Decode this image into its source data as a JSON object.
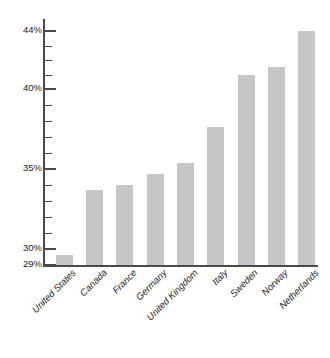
{
  "chart_data": {
    "type": "bar",
    "title": "",
    "subtitle": "",
    "xlabel": "",
    "ylabel": "",
    "categories": [
      "United States",
      "Canada",
      "France",
      "Germany",
      "United Kingdom",
      "Italy",
      "Sweden",
      "Norway",
      "Netherlands"
    ],
    "values": [
      29.6,
      33.7,
      34.0,
      34.7,
      35.4,
      37.6,
      41.0,
      41.5,
      44.0
    ],
    "value_unit": "%",
    "ylim": [
      29,
      44.6
    ],
    "ytick_labels": [
      "29%",
      "30%",
      "35%",
      "40%",
      "44%"
    ],
    "ytick_values": [
      29,
      30,
      35,
      40,
      44
    ],
    "minor_tick_values": [
      31,
      32,
      33,
      34,
      36,
      37,
      38,
      39,
      41,
      42,
      43
    ],
    "grid": false,
    "legend": false,
    "bar_color": "#c6c6c6",
    "axis_color": "#4a4a4a",
    "background_color": "#ffffff"
  },
  "axis": {
    "y_tick_labels": [
      {
        "text": "44%",
        "value": 44
      },
      {
        "text": "40%",
        "value": 40
      },
      {
        "text": "35%",
        "value": 35
      },
      {
        "text": "30%",
        "value": 30
      },
      {
        "text": "29%",
        "value": 29
      }
    ]
  }
}
